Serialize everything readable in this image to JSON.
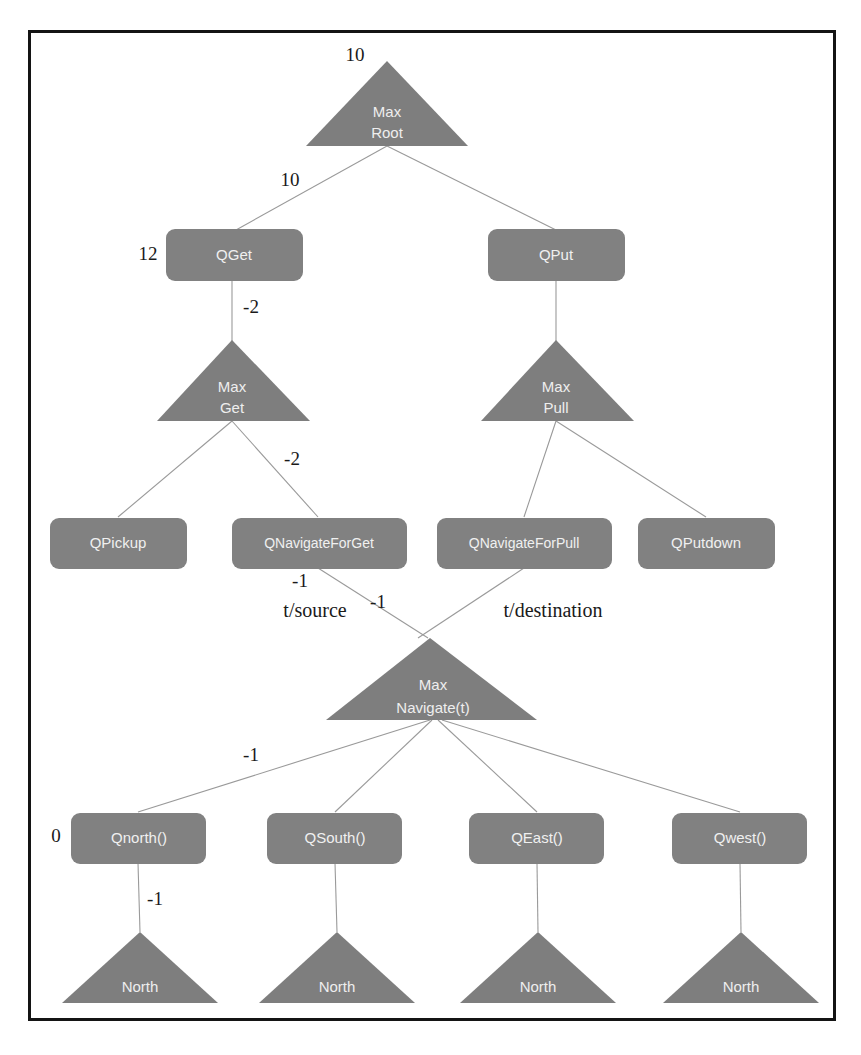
{
  "figure": {
    "kind": "tree-diagram",
    "frame": {
      "x": 28,
      "y": 30,
      "width": 807,
      "height": 990,
      "color": "#141414"
    },
    "colors": {
      "node_fill": "#818181",
      "triangle_fill": "#7e7e7e",
      "node_text": "#f0f0f0",
      "edge_line": "#9a9a9a",
      "edge_label": "#1a1a1a",
      "background": "#ffffff"
    }
  },
  "nodes": {
    "max_root": {
      "label_line1": "Max",
      "label_line2": "Root",
      "shape": "triangle"
    },
    "qget": {
      "label": "QGet",
      "shape": "rounded-rect"
    },
    "qput": {
      "label": "QPut",
      "shape": "rounded-rect"
    },
    "max_get": {
      "label_line1": "Max",
      "label_line2": "Get",
      "shape": "triangle"
    },
    "max_pull": {
      "label_line1": "Max",
      "label_line2": "Pull",
      "shape": "triangle"
    },
    "qpickup": {
      "label": "QPickup",
      "shape": "rounded-rect"
    },
    "qnavigate_for_get": {
      "label": "QNavigateForGet",
      "shape": "rounded-rect"
    },
    "qnavigate_for_pull": {
      "label": "QNavigateForPull",
      "shape": "rounded-rect"
    },
    "qputdown": {
      "label": "QPutdown",
      "shape": "rounded-rect"
    },
    "max_navigate": {
      "label_line1": "Max",
      "label_line2": "Navigate(t)",
      "shape": "triangle"
    },
    "qnorth": {
      "label": "Qnorth()",
      "shape": "rounded-rect"
    },
    "qsouth": {
      "label": "QSouth()",
      "shape": "rounded-rect"
    },
    "qeast": {
      "label": "QEast()",
      "shape": "rounded-rect"
    },
    "qwest": {
      "label": "Qwest()",
      "shape": "rounded-rect"
    },
    "north_1": {
      "label": "North",
      "shape": "triangle"
    },
    "north_2": {
      "label": "North",
      "shape": "triangle"
    },
    "north_3": {
      "label": "North",
      "shape": "triangle"
    },
    "north_4": {
      "label": "North",
      "shape": "triangle"
    }
  },
  "labels": {
    "root_value": "10",
    "root_to_qget": "10",
    "qget_value": "12",
    "qget_to_maxget": "-2",
    "maxget_to_qnav": "-2",
    "qnavget_edge": "-1",
    "qnavpull_edge": "-1",
    "t_source": "t/source",
    "t_destination": "t/destination",
    "navigate_to_qnorth": "-1",
    "qnorth_value": "0",
    "qnorth_to_north": "-1"
  }
}
